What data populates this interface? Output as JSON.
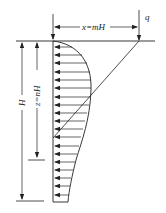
{
  "diagram": {
    "type": "lateral pressure distribution on wall",
    "labels": {
      "load": "q",
      "offset": "x=mH",
      "depth": "z=nH",
      "height": "H"
    },
    "colors": {
      "stroke": "#222222",
      "background": "#ffffff"
    },
    "arrow_count": 19
  }
}
